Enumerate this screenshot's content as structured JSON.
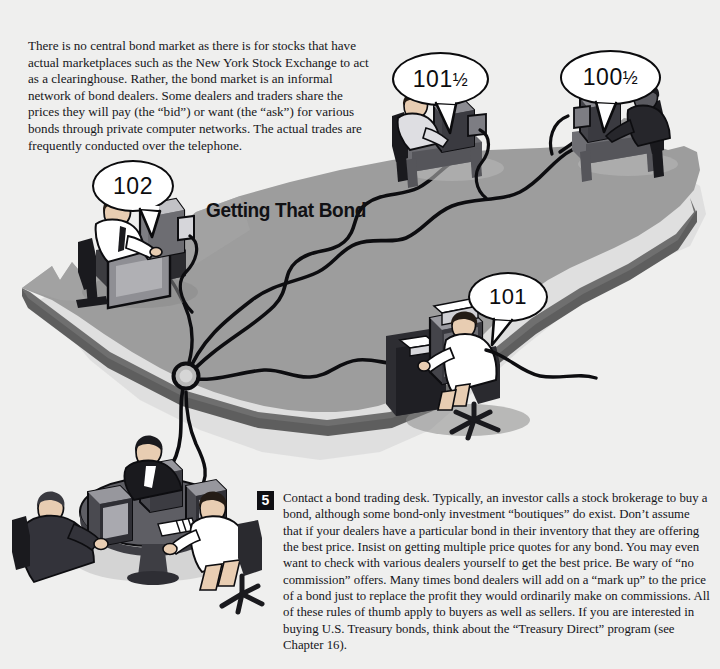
{
  "page": {
    "background_color": "#efefee",
    "title": "Getting That Bond"
  },
  "intro": {
    "text": "There is no central bond market as there is for stocks that have actual marketplaces such as the New York Stock Exchange to act as a clearinghouse. Rather, the bond market is an informal network of bond dealers. Some dealers and traders share the prices they will pay (the “bid”) or want (the “ask”) for various bonds through private computer networks. The actual trades are frequently conducted over the telephone."
  },
  "step": {
    "number": "5",
    "text": "Contact a bond trading desk. Typically, an investor calls a stock brokerage to buy a bond, although some bond-only investment “boutiques” do exist. Don’t assume that if your dealers have a particular bond in their inventory that they are offering the best price. Insist on getting multiple price quotes for any bond. You may even want to check with various dealers yourself to get the best price. Be wary of “no commission” offers. Many times bond dealers will add on a “mark up” to the price of a bond just to replace the profit they would ordinarily make on commissions. All of these rules of thumb apply to buyers as well as sellers. If you are interested in buying U.S. Treasury bonds, think about the “Treasury Direct” program (see Chapter 16)."
  },
  "quotes": [
    {
      "id": "quote-102",
      "whole": "102",
      "fraction": "",
      "label": "102"
    },
    {
      "id": "quote-101-half",
      "whole": "101",
      "fraction": "½",
      "label": "101½"
    },
    {
      "id": "quote-100-half",
      "whole": "100",
      "fraction": "½",
      "label": "100½"
    },
    {
      "id": "quote-101",
      "whole": "101",
      "fraction": "",
      "label": "101"
    }
  ],
  "colors": {
    "map_top": "#9d9d9d",
    "map_side": "#6f6f6f",
    "map_shadow": "#b8b8b8",
    "ink": "#0b0b0d",
    "paper": "#ffffff",
    "badge": "#101014"
  },
  "scene": {
    "map_name": "united-states-map",
    "hub_name": "network-hub-node",
    "workstations": [
      {
        "name": "trader-west-desk",
        "quote": "102"
      },
      {
        "name": "trader-north-desk",
        "quote": "101½"
      },
      {
        "name": "trader-northeast-desk",
        "quote": "100½"
      },
      {
        "name": "trader-southeast-desk",
        "quote": "101"
      },
      {
        "name": "bond-trading-desk-group",
        "quote": ""
      }
    ]
  }
}
